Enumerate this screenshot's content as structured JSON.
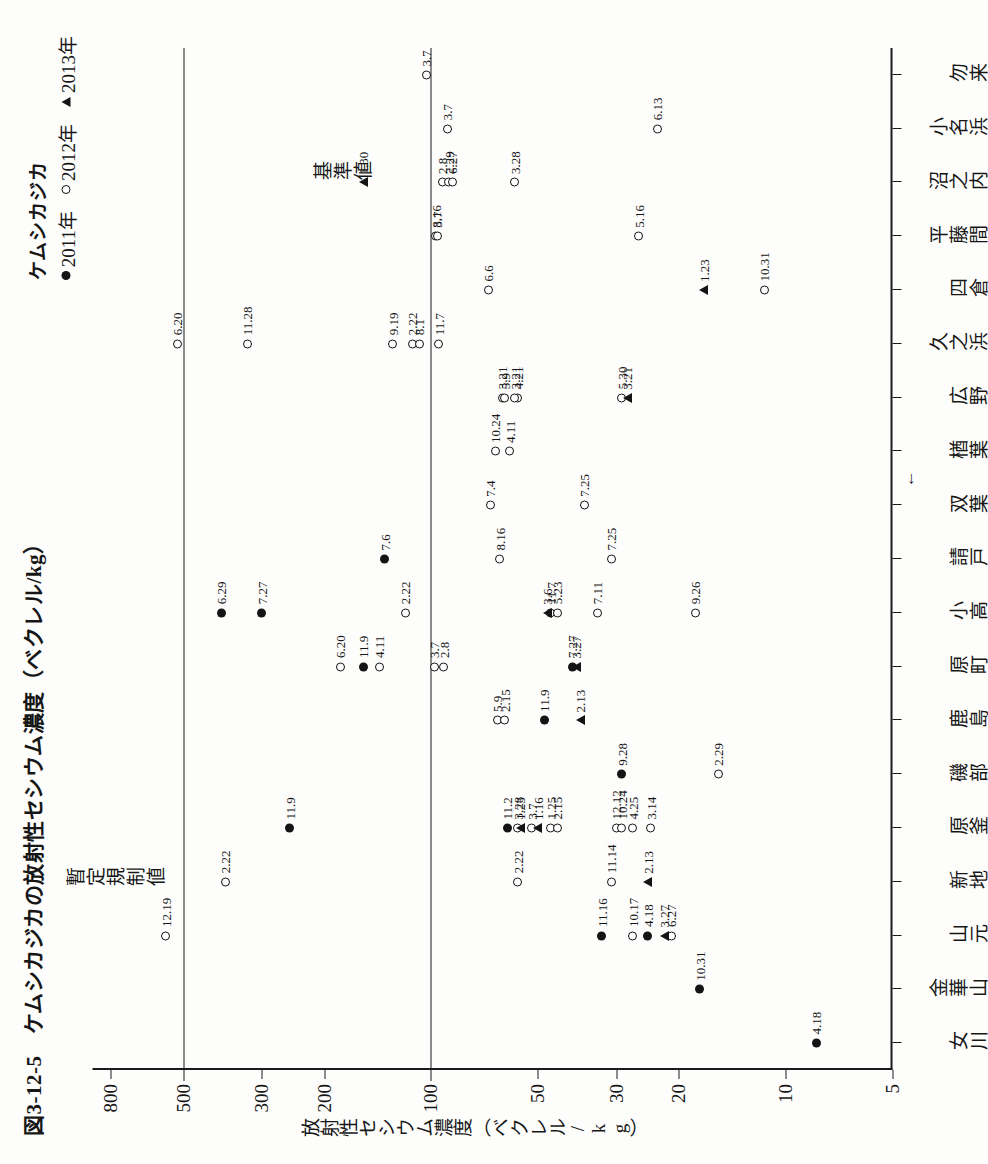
{
  "figure": {
    "number": "図3-12-5",
    "title": "図3-12-5　ケムシカジカの放射性セシウム濃度（ベクレル/kg）",
    "value_axis_caption": "放射性セシウム濃度（ベクレル/kg）"
  },
  "legend": {
    "title": "ケムシカジカ",
    "items": [
      {
        "label": "2011年",
        "marker": "filled-circle-icon"
      },
      {
        "label": "2012年",
        "marker": "open-circle-icon"
      },
      {
        "label": "2013年",
        "marker": "filled-triangle-icon"
      }
    ]
  },
  "reference_lines": [
    {
      "label": "暫定規制値",
      "value": 500
    },
    {
      "label": "基準値",
      "value": 100
    }
  ],
  "annotations": [
    {
      "label": "福島第一原発",
      "marker": "left-arrow-icon"
    }
  ],
  "chart_data": {
    "type": "scatter",
    "title": "ケムシカジカの放射性セシウム濃度（ベクレル/kg）",
    "xlabel": "",
    "ylabel": "放射性セシウム濃度（ベクレル/kg）",
    "yscale": "log",
    "ylim": [
      5,
      900
    ],
    "yticks": [
      800,
      500,
      300,
      200,
      100,
      50,
      30,
      20,
      10,
      5
    ],
    "ytick_labels": [
      "800",
      "500",
      "300",
      "200",
      "100",
      "50",
      "30",
      "20",
      "10",
      "5"
    ],
    "grid": false,
    "legend_position": "top-right",
    "categories": [
      "女川",
      "金華山",
      "山元",
      "新地",
      "原釜",
      "磯部",
      "鹿島",
      "原町",
      "小高",
      "請戸",
      "双葉",
      "楢葉",
      "広野",
      "久之浜",
      "四倉",
      "平藤間",
      "沼之内",
      "小名浜",
      "勿来"
    ],
    "series": [
      {
        "name": "2011年",
        "marker": "filled-circle",
        "points": [
          {
            "category": "女川",
            "value": 8.2,
            "date": "4.18"
          },
          {
            "category": "金華山",
            "value": 17.5,
            "date": "10.31"
          },
          {
            "category": "山元",
            "value": 24.5,
            "date": "4.18"
          },
          {
            "category": "山元",
            "value": 33,
            "date": "11.16"
          },
          {
            "category": "原釜",
            "value": 250,
            "date": "11.9"
          },
          {
            "category": "原釜",
            "value": 61,
            "date": "11.2"
          },
          {
            "category": "磯部",
            "value": 29,
            "date": "9.28"
          },
          {
            "category": "鹿島",
            "value": 48,
            "date": "11.9"
          },
          {
            "category": "原町",
            "value": 155,
            "date": "11.9"
          },
          {
            "category": "原町",
            "value": 40,
            "date": "7.27"
          },
          {
            "category": "小高",
            "value": 390,
            "date": "6.29"
          },
          {
            "category": "小高",
            "value": 300,
            "date": "7.27"
          },
          {
            "category": "請戸",
            "value": 135,
            "date": "7.6"
          }
        ]
      },
      {
        "name": "2012年",
        "marker": "open-circle",
        "points": [
          {
            "category": "山元",
            "value": 27,
            "date": "10.17"
          },
          {
            "category": "山元",
            "value": 21,
            "date": "6.27"
          },
          {
            "category": "新地",
            "value": 31,
            "date": "11.14"
          },
          {
            "category": "新地",
            "value": 57,
            "date": "2.22"
          },
          {
            "category": "原釜",
            "value": 57,
            "date": "3.28"
          },
          {
            "category": "原釜",
            "value": 46,
            "date": "1.25"
          },
          {
            "category": "原釜",
            "value": 44,
            "date": "2.15"
          },
          {
            "category": "原釜",
            "value": 52,
            "date": "3.7"
          },
          {
            "category": "原釜",
            "value": 30,
            "date": "12.12"
          },
          {
            "category": "原釜",
            "value": 27,
            "date": "4.25"
          },
          {
            "category": "原釜",
            "value": 24,
            "date": "3.14"
          },
          {
            "category": "原釜",
            "value": 29,
            "date": "10.24"
          },
          {
            "category": "磯部",
            "value": 15.5,
            "date": "2.29"
          },
          {
            "category": "鹿島",
            "value": 65,
            "date": "5.9"
          },
          {
            "category": "鹿島",
            "value": 62,
            "date": "2.15"
          },
          {
            "category": "原町",
            "value": 98,
            "date": "3.7"
          },
          {
            "category": "原町",
            "value": 92,
            "date": "2.8"
          },
          {
            "category": "原町",
            "value": 180,
            "date": "6.20"
          },
          {
            "category": "原町",
            "value": 140,
            "date": "4.11"
          },
          {
            "category": "小高",
            "value": 118,
            "date": "2.22"
          },
          {
            "category": "小高",
            "value": 46,
            "date": "11.7"
          },
          {
            "category": "小高",
            "value": 44,
            "date": "5.23"
          },
          {
            "category": "小高",
            "value": 34,
            "date": "7.11"
          },
          {
            "category": "小高",
            "value": 18,
            "date": "9.26"
          },
          {
            "category": "請戸",
            "value": 64,
            "date": "8.16"
          },
          {
            "category": "請戸",
            "value": 31,
            "date": "7.25"
          },
          {
            "category": "双葉",
            "value": 68,
            "date": "7.4"
          },
          {
            "category": "双葉",
            "value": 37,
            "date": "7.25"
          },
          {
            "category": "楢葉",
            "value": 66,
            "date": "10.24"
          },
          {
            "category": "楢葉",
            "value": 60,
            "date": "4.11"
          },
          {
            "category": "広野",
            "value": 63,
            "date": "3.21"
          },
          {
            "category": "広野",
            "value": 62,
            "date": "5.9"
          },
          {
            "category": "広野",
            "value": 57,
            "date": "4.21"
          },
          {
            "category": "広野",
            "value": 58,
            "date": "3.21"
          },
          {
            "category": "広野",
            "value": 29,
            "date": "5.30"
          },
          {
            "category": "久之浜",
            "value": 113,
            "date": "2.22"
          },
          {
            "category": "久之浜",
            "value": 108,
            "date": "8.1"
          },
          {
            "category": "久之浜",
            "value": 95,
            "date": "11.7"
          },
          {
            "category": "久之浜",
            "value": 128,
            "date": "9.19"
          },
          {
            "category": "久之浜",
            "value": 520,
            "date": "6.20"
          },
          {
            "category": "久之浜",
            "value": 330,
            "date": "11.28"
          },
          {
            "category": "四倉",
            "value": 69,
            "date": "6.6"
          },
          {
            "category": "四倉",
            "value": 11.5,
            "date": "10.31"
          },
          {
            "category": "平藤間",
            "value": 97,
            "date": "8.16"
          },
          {
            "category": "平藤間",
            "value": 96,
            "date": "3.7"
          },
          {
            "category": "平藤間",
            "value": 26,
            "date": "5.16"
          },
          {
            "category": "沼之内",
            "value": 93,
            "date": "2.8"
          },
          {
            "category": "沼之内",
            "value": 89,
            "date": "2.29"
          },
          {
            "category": "沼之内",
            "value": 87,
            "date": "6.27"
          },
          {
            "category": "沼之内",
            "value": 58,
            "date": "3.28"
          },
          {
            "category": "小名浜",
            "value": 90,
            "date": "3.7"
          },
          {
            "category": "小名浜",
            "value": 23,
            "date": "6.13"
          },
          {
            "category": "勿来",
            "value": 103,
            "date": "3.7"
          },
          {
            "category": "山元",
            "value": 560,
            "date": "12.19"
          },
          {
            "category": "新地",
            "value": 380,
            "date": "2.22"
          }
        ]
      },
      {
        "name": "2013年",
        "marker": "filled-triangle",
        "points": [
          {
            "category": "山元",
            "value": 22,
            "date": "3.27"
          },
          {
            "category": "新地",
            "value": 24.5,
            "date": "2.13"
          },
          {
            "category": "原釜",
            "value": 56,
            "date": "1.23"
          },
          {
            "category": "原釜",
            "value": 50,
            "date": "1.16"
          },
          {
            "category": "鹿島",
            "value": 38,
            "date": "2.13"
          },
          {
            "category": "原町",
            "value": 39,
            "date": "3.27"
          },
          {
            "category": "小高",
            "value": 47,
            "date": "3.6"
          },
          {
            "category": "広野",
            "value": 28,
            "date": "3.21"
          },
          {
            "category": "四倉",
            "value": 17,
            "date": "1.23"
          },
          {
            "category": "沼之内",
            "value": 155,
            "date": "1.30"
          }
        ]
      }
    ]
  }
}
